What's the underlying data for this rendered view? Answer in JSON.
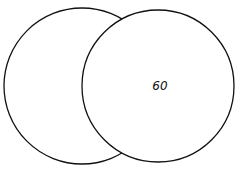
{
  "diagram": {
    "type": "venn",
    "sets": [
      {
        "id": "left",
        "label": "",
        "cx": 82,
        "cy": 86,
        "r": 78
      },
      {
        "id": "right",
        "label": "",
        "cx": 158,
        "cy": 86,
        "r": 76
      }
    ],
    "regions": {
      "left_only": "",
      "intersection": "",
      "right_only": "60"
    },
    "colors": {
      "stroke": "#111111",
      "background": "#ffffff"
    }
  }
}
